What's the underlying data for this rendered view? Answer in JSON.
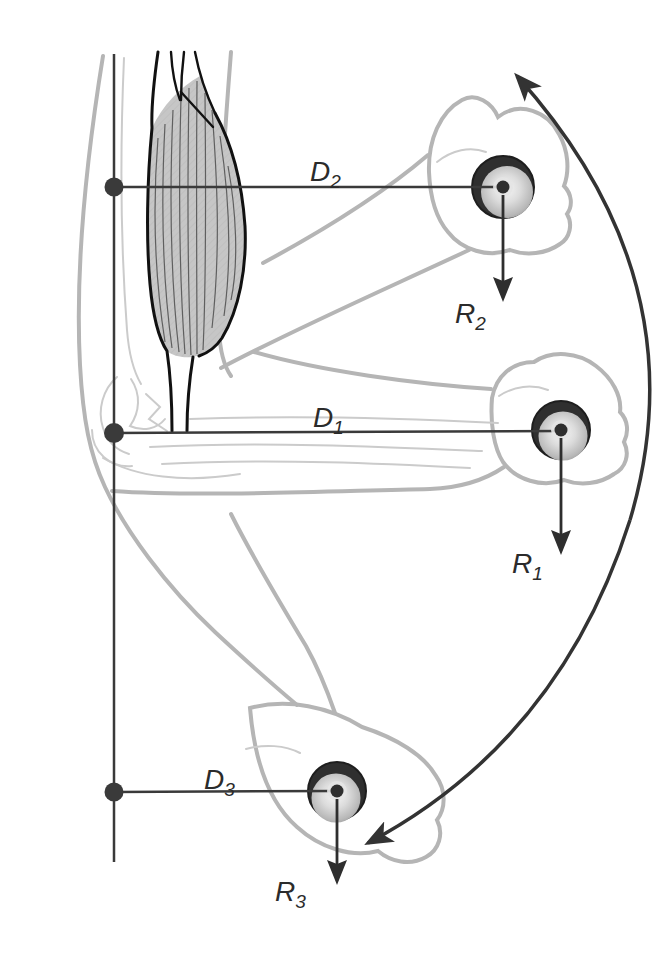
{
  "figure": {
    "kind": "biomechanics-elbow-flexion-diagram",
    "labels": {
      "d1": {
        "main": "D",
        "sub": "1"
      },
      "d2": {
        "main": "D",
        "sub": "2"
      },
      "d3": {
        "main": "D",
        "sub": "3"
      },
      "r1": {
        "main": "R",
        "sub": "1"
      },
      "r2": {
        "main": "R",
        "sub": "2"
      },
      "r3": {
        "main": "R",
        "sub": "3"
      }
    },
    "colors": {
      "background": "#ffffff",
      "measure_line": "#3a3a3a",
      "motion_arc": "#333333",
      "force_arrow": "#2e2e2e",
      "body_outline": "#b5b5b5",
      "bone_outline": "#cbcbcb",
      "muscle_outline": "#111111",
      "muscle_fill": "#c6c6c6",
      "weight_rim": "#2f2f2f",
      "label_text": "#2b2b2b"
    }
  }
}
